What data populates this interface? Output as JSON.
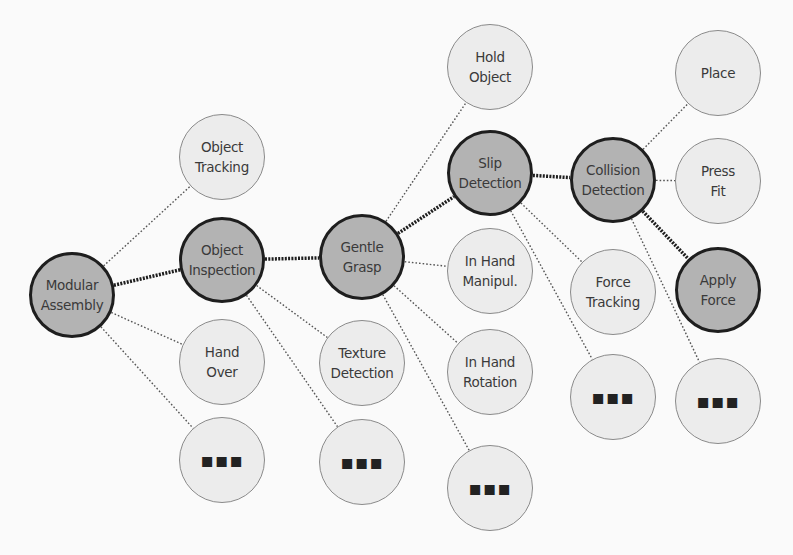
{
  "diagram": {
    "colors": {
      "background": "#fafafa",
      "light_fill": "#ececec",
      "light_stroke": "#8a8a8a",
      "dark_fill": "#b3b3b3",
      "dark_stroke": "#1e1e1e",
      "edge_color": "#333333"
    },
    "radius": 43,
    "nodes": [
      {
        "id": "modular-assembly",
        "label": "Modular\nAssembly",
        "x": 72,
        "y": 295,
        "style": "dark"
      },
      {
        "id": "object-tracking",
        "label": "Object\nTracking",
        "x": 222,
        "y": 157,
        "style": "light"
      },
      {
        "id": "object-inspection",
        "label": "Object\nInspection",
        "x": 222,
        "y": 260,
        "style": "dark"
      },
      {
        "id": "hand-over",
        "label": "Hand\nOver",
        "x": 222,
        "y": 362,
        "style": "light"
      },
      {
        "id": "more-1",
        "label": "...",
        "x": 222,
        "y": 460,
        "style": "light"
      },
      {
        "id": "gentle-grasp",
        "label": "Gentle\nGrasp",
        "x": 362,
        "y": 257,
        "style": "dark"
      },
      {
        "id": "texture-detection",
        "label": "Texture\nDetection",
        "x": 362,
        "y": 363,
        "style": "light"
      },
      {
        "id": "more-2",
        "label": "...",
        "x": 362,
        "y": 462,
        "style": "light"
      },
      {
        "id": "hold-object",
        "label": "Hold\nObject",
        "x": 490,
        "y": 67,
        "style": "light"
      },
      {
        "id": "slip-detection",
        "label": "Slip\nDetection",
        "x": 490,
        "y": 173,
        "style": "dark"
      },
      {
        "id": "in-hand-manipul",
        "label": "In Hand\nManipul.",
        "x": 490,
        "y": 271,
        "style": "light"
      },
      {
        "id": "in-hand-rotation",
        "label": "In Hand\nRotation",
        "x": 490,
        "y": 372,
        "style": "light"
      },
      {
        "id": "more-3",
        "label": "...",
        "x": 490,
        "y": 488,
        "style": "light"
      },
      {
        "id": "collision-detection",
        "label": "Collision\nDetection",
        "x": 613,
        "y": 180,
        "style": "dark"
      },
      {
        "id": "force-tracking",
        "label": "Force\nTracking",
        "x": 613,
        "y": 292,
        "style": "light"
      },
      {
        "id": "more-4",
        "label": "...",
        "x": 613,
        "y": 397,
        "style": "light"
      },
      {
        "id": "place",
        "label": "Place",
        "x": 718,
        "y": 73,
        "style": "light"
      },
      {
        "id": "press-fit",
        "label": "Press\nFit",
        "x": 718,
        "y": 181,
        "style": "light"
      },
      {
        "id": "apply-force",
        "label": "Apply\nForce",
        "x": 718,
        "y": 290,
        "style": "dark"
      },
      {
        "id": "more-5",
        "label": "...",
        "x": 718,
        "y": 401,
        "style": "light"
      }
    ],
    "edges": [
      {
        "from": "modular-assembly",
        "to": "object-inspection",
        "style": "thick"
      },
      {
        "from": "modular-assembly",
        "to": "object-tracking",
        "style": "thin"
      },
      {
        "from": "modular-assembly",
        "to": "hand-over",
        "style": "thin"
      },
      {
        "from": "modular-assembly",
        "to": "more-1",
        "style": "thin"
      },
      {
        "from": "object-inspection",
        "to": "gentle-grasp",
        "style": "thick"
      },
      {
        "from": "object-inspection",
        "to": "texture-detection",
        "style": "thin"
      },
      {
        "from": "object-inspection",
        "to": "more-2",
        "style": "thin"
      },
      {
        "from": "gentle-grasp",
        "to": "slip-detection",
        "style": "thick"
      },
      {
        "from": "gentle-grasp",
        "to": "hold-object",
        "style": "thin"
      },
      {
        "from": "gentle-grasp",
        "to": "in-hand-manipul",
        "style": "thin"
      },
      {
        "from": "gentle-grasp",
        "to": "in-hand-rotation",
        "style": "thin"
      },
      {
        "from": "gentle-grasp",
        "to": "more-3",
        "style": "thin"
      },
      {
        "from": "slip-detection",
        "to": "collision-detection",
        "style": "thick"
      },
      {
        "from": "slip-detection",
        "to": "force-tracking",
        "style": "thin"
      },
      {
        "from": "slip-detection",
        "to": "more-4",
        "style": "thin"
      },
      {
        "from": "collision-detection",
        "to": "apply-force",
        "style": "thick"
      },
      {
        "from": "collision-detection",
        "to": "place",
        "style": "thin"
      },
      {
        "from": "collision-detection",
        "to": "press-fit",
        "style": "thin"
      },
      {
        "from": "collision-detection",
        "to": "more-5",
        "style": "thin"
      }
    ]
  }
}
